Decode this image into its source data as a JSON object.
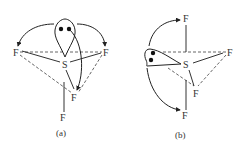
{
  "figure": {
    "colors": {
      "ink": "#333333",
      "background": "#ffffff"
    },
    "panels": [
      {
        "id": "a",
        "caption": "(a)",
        "central_atom": "S",
        "ligands": [
          "F",
          "F",
          "F",
          "F"
        ],
        "lone_pair": "equatorial lobe with two electrons",
        "arrows": 3
      },
      {
        "id": "b",
        "caption": "(b)",
        "central_atom": "S",
        "ligands": [
          "F",
          "F",
          "F",
          "F"
        ],
        "lone_pair": "equatorial lobe pointing left with two electrons",
        "arrows": 2
      }
    ]
  }
}
